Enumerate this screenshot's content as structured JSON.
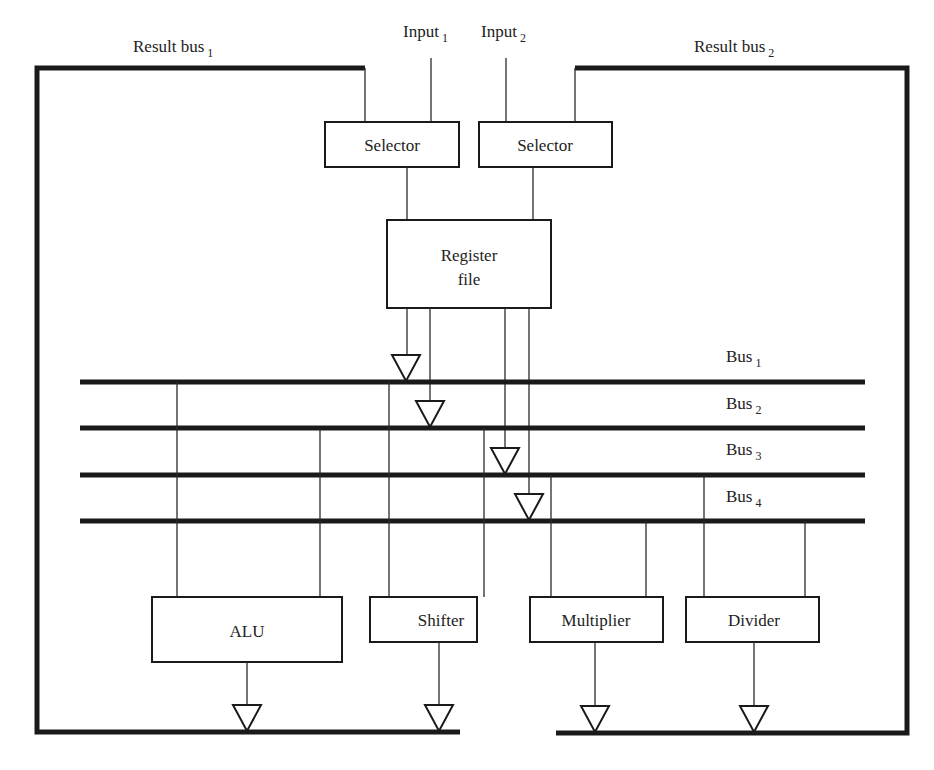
{
  "diagram": {
    "result_buses": [
      {
        "label": "Result bus",
        "sub": "1"
      },
      {
        "label": "Result bus",
        "sub": "2"
      }
    ],
    "inputs": [
      {
        "label": "Input",
        "sub": "1"
      },
      {
        "label": "Input",
        "sub": "2"
      }
    ],
    "selectors": [
      {
        "label": "Selector"
      },
      {
        "label": "Selector"
      }
    ],
    "register_file": {
      "line1": "Register",
      "line2": "file"
    },
    "buses": [
      {
        "label": "Bus",
        "sub": "1"
      },
      {
        "label": "Bus",
        "sub": "2"
      },
      {
        "label": "Bus",
        "sub": "3"
      },
      {
        "label": "Bus",
        "sub": "4"
      }
    ],
    "units": [
      {
        "label": "ALU"
      },
      {
        "label": "Shifter"
      },
      {
        "label": "Multiplier"
      },
      {
        "label": "Divider"
      }
    ]
  }
}
